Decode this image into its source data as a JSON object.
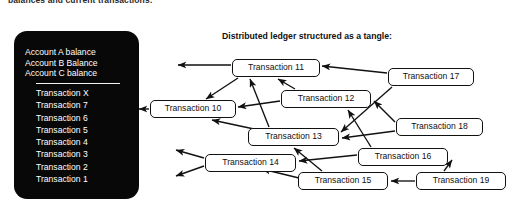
{
  "page": {
    "top_caption": "balances and current transactions:",
    "width": 518,
    "height": 217,
    "background": "#ffffff"
  },
  "ledger_panel": {
    "name": "account-ledger-device",
    "background": "#080808",
    "text_color": "#ffffff",
    "accounts": [
      "Account A balance",
      "Account B Balance",
      "Account C balance"
    ],
    "transactions": [
      "Transaction X",
      "Transaction 7",
      "Transaction 6",
      "Transaction 5",
      "Transaction 4",
      "Transaction 3",
      "Transaction 2",
      "Transaction 1"
    ]
  },
  "tangle": {
    "title": "Distributed ledger structured as a tangle:",
    "stroke": "#111111",
    "node_fill": "#ffffff",
    "nodes": [
      {
        "id": "tx10",
        "label": "Transaction 10",
        "x": 150,
        "y": 100,
        "w": 86
      },
      {
        "id": "tx11",
        "label": "Transaction 11",
        "x": 232,
        "y": 59,
        "w": 88
      },
      {
        "id": "tx12",
        "label": "Transaction 12",
        "x": 281,
        "y": 90,
        "w": 90
      },
      {
        "id": "tx13",
        "label": "Transaction 13",
        "x": 248,
        "y": 128,
        "w": 91
      },
      {
        "id": "tx14",
        "label": "Transaction 14",
        "x": 205,
        "y": 154,
        "w": 91
      },
      {
        "id": "tx15",
        "label": "Transaction 15",
        "x": 298,
        "y": 172,
        "w": 90
      },
      {
        "id": "tx16",
        "label": "Transaction 16",
        "x": 358,
        "y": 148,
        "w": 90
      },
      {
        "id": "tx17",
        "label": "Transaction 17",
        "x": 388,
        "y": 68,
        "w": 86
      },
      {
        "id": "tx18",
        "label": "Transaction 18",
        "x": 396,
        "y": 118,
        "w": 87
      },
      {
        "id": "tx19",
        "label": "Transaction 19",
        "x": 416,
        "y": 172,
        "w": 90
      }
    ],
    "edges": [
      {
        "from": "tx11",
        "to": "tx10"
      },
      {
        "from": "tx11",
        "to": "exit-top"
      },
      {
        "from": "tx12",
        "to": "tx11"
      },
      {
        "from": "tx12",
        "to": "tx10"
      },
      {
        "from": "tx13",
        "to": "tx11"
      },
      {
        "from": "tx13",
        "to": "tx10"
      },
      {
        "from": "tx17",
        "to": "tx11"
      },
      {
        "from": "tx17",
        "to": "tx13"
      },
      {
        "from": "tx18",
        "to": "tx12"
      },
      {
        "from": "tx18",
        "to": "tx13"
      },
      {
        "from": "tx16",
        "to": "tx12"
      },
      {
        "from": "tx16",
        "to": "tx14"
      },
      {
        "from": "tx15",
        "to": "tx13"
      },
      {
        "from": "tx15",
        "to": "tx14"
      },
      {
        "from": "tx19",
        "to": "tx15"
      },
      {
        "from": "tx19",
        "to": "tx16"
      },
      {
        "from": "tx10",
        "to": "exit-left"
      },
      {
        "from": "tx14",
        "to": "exit-left-upper"
      },
      {
        "from": "tx14",
        "to": "exit-left-lower"
      }
    ]
  }
}
